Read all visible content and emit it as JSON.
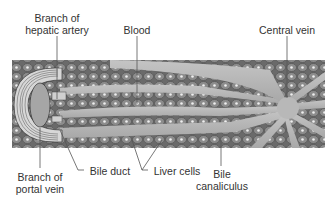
{
  "diagram": {
    "labels": {
      "hepatic_artery": [
        "Branch of",
        "hepatic artery"
      ],
      "blood": "Blood",
      "central_vein": "Central vein",
      "portal_vein": [
        "Branch of",
        "portal vein"
      ],
      "bile_duct": "Bile duct",
      "liver_cells": "Liver cells",
      "bile_canaliculus": [
        "Bile",
        "canaliculus"
      ]
    },
    "colors": {
      "background": "#ffffff",
      "tissue_dark": "#5f5f5f",
      "sinusoid": "#b5b5b5",
      "cell": "#8a8a8a",
      "nucleus": "#e8e8e8",
      "leader_line": "#555555"
    }
  }
}
